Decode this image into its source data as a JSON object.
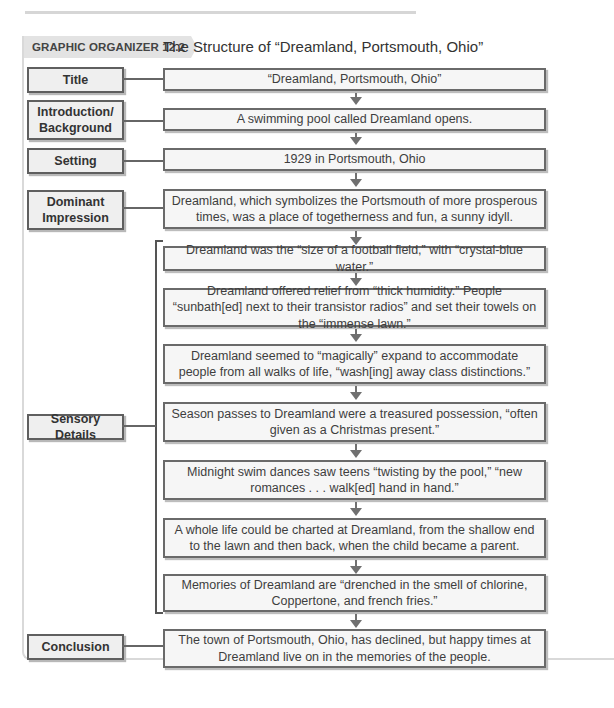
{
  "header": {
    "tag": "GRAPHIC ORGANIZER 12.2",
    "title": "The Structure of “Dreamland, Portsmouth, Ohio”"
  },
  "rows": [
    {
      "label": "Title",
      "content": "“Dreamland, Portsmouth, Ohio”"
    },
    {
      "label": "Introduction/ Background",
      "content": "A swimming pool called Dreamland opens."
    },
    {
      "label": "Setting",
      "content": "1929 in Portsmouth, Ohio"
    },
    {
      "label": "Dominant Impression",
      "content": "Dreamland, which symbolizes the Portsmouth of more prosperous times, was a place of togetherness and fun, a sunny idyll."
    }
  ],
  "sensory": {
    "label": "Sensory Details",
    "details": [
      "Dreamland was the “size of a football field,” with “crystal-blue water.”",
      "Dreamland offered relief from “thick humidity.” People “sunbath[ed] next to their transistor radios” and set their towels on the “immense lawn.”",
      "Dreamland seemed to “magically” expand to accommodate people from all walks of life, “wash[ing] away class distinctions.”",
      "Season passes to Dreamland were a treasured possession, “often given as a Christmas present.”",
      "Midnight swim dances saw teens “twisting by the pool,” “new romances . . . walk[ed] hand in hand.”",
      "A whole life could be charted at Dreamland, from the shallow end to the lawn and then back, when the child became a parent.",
      "Memories of Dreamland are “drenched in the smell of chlorine, Coppertone, and french fries.”"
    ]
  },
  "conclusion": {
    "label": "Conclusion",
    "content": "The town of Portsmouth, Ohio, has declined, but happy times at Dreamland live on in the memories of the people."
  }
}
